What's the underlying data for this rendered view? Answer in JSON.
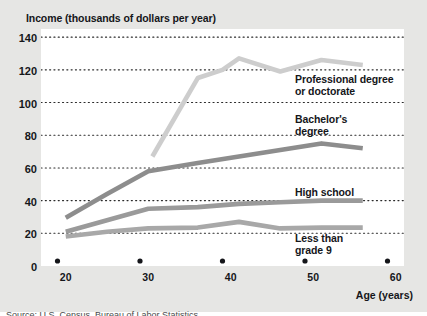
{
  "figure": {
    "background_color": "#e6e6e4",
    "plot_background_color": "#ffffff"
  },
  "axis_titles": {
    "y": "Income (thousands of dollars per year)",
    "x": "Age (years)"
  },
  "series_labels": {
    "professional": "Professional degree\nor doctorate",
    "bachelors": "Bachelor's\ndegree",
    "highschool": "High school",
    "lessthan9": "Less than\ngrade 9"
  },
  "source": {
    "text": "Source: U.S. Census, Bureau of Labor Statistics"
  },
  "chart_data": {
    "type": "line",
    "title": "Income (thousands of dollars per year)",
    "xlabel": "Age (years)",
    "ylabel": "Income (thousands of dollars per year)",
    "xlim": [
      18,
      62
    ],
    "ylim": [
      0,
      145
    ],
    "xticks": [
      20,
      30,
      40,
      50,
      60
    ],
    "yticks": [
      0,
      20,
      40,
      60,
      80,
      100,
      120,
      140
    ],
    "grid": "horizontal-dotted",
    "legend": "inline-labels",
    "series": [
      {
        "name": "Professional degree or doctorate",
        "color": "#cdcdcd",
        "x": [
          31.5,
          37,
          40,
          42,
          47,
          52,
          57
        ],
        "values": [
          67,
          115,
          120,
          127,
          119,
          126,
          123
        ]
      },
      {
        "name": "Bachelor's degree",
        "color": "#8d8d8d",
        "x": [
          21,
          26,
          31,
          37,
          42,
          47,
          52,
          57
        ],
        "values": [
          29.5,
          44,
          58,
          63,
          67,
          71,
          75,
          72
        ]
      },
      {
        "name": "High school",
        "color": "#9a9a9a",
        "x": [
          21,
          26,
          31,
          37,
          42,
          47,
          52,
          57
        ],
        "values": [
          21,
          28,
          35,
          36,
          38,
          39,
          40,
          40
        ]
      },
      {
        "name": "Less than grade 9",
        "color": "#a8a8a8",
        "x": [
          21,
          26,
          31,
          37,
          42,
          47,
          52,
          57
        ],
        "values": [
          18,
          21,
          23,
          23.5,
          27,
          23,
          23.5,
          23.5
        ]
      }
    ]
  }
}
